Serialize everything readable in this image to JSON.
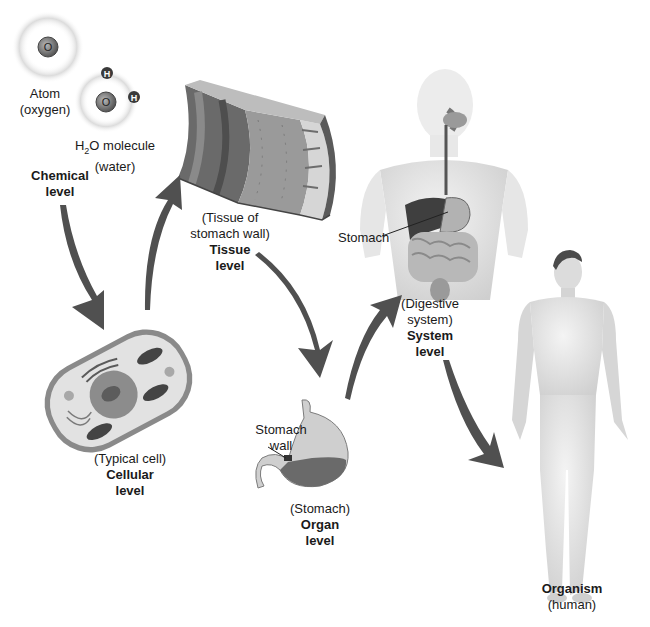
{
  "diagram": {
    "arrow_color": "#505050",
    "levels": [
      {
        "id": "chemical",
        "level_name": "Chemical",
        "level_word": "level",
        "items": [
          {
            "label_line1": "Atom",
            "label_line2": "(oxygen)",
            "symbol": "O"
          },
          {
            "label_prefix": "H",
            "label_subscript": "2",
            "label_suffix": "O molecule",
            "label_line2": "(water)",
            "symbols": [
              "H",
              "O",
              "H"
            ]
          }
        ]
      },
      {
        "id": "cellular",
        "level_name": "Cellular",
        "level_word": "level",
        "descriptor": "(Typical cell)"
      },
      {
        "id": "tissue",
        "level_name": "Tissue",
        "level_word": "level",
        "descriptor_line1": "(Tissue of",
        "descriptor_line2": "stomach wall)"
      },
      {
        "id": "organ",
        "level_name": "Organ",
        "level_word": "level",
        "descriptor": "(Stomach)",
        "callout_line1": "Stomach",
        "callout_line2": "wall"
      },
      {
        "id": "system",
        "level_name": "System",
        "level_word": "level",
        "descriptor_line1": "(Digestive",
        "descriptor_line2": "system)",
        "callout": "Stomach"
      },
      {
        "id": "organism",
        "level_name": "Organism",
        "descriptor": "(human)"
      }
    ]
  }
}
